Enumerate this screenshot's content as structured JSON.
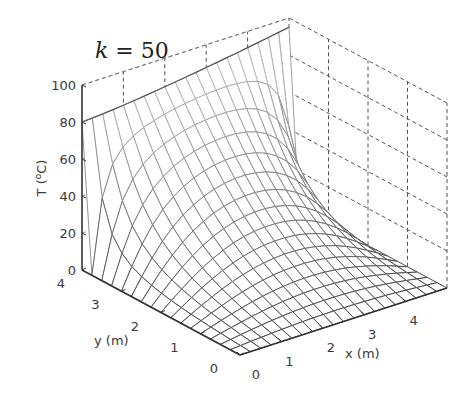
{
  "chart_data": {
    "type": "surface",
    "title_var": "k",
    "title_eq": " = 50",
    "title": "k = 50",
    "xlabel": "x (m)",
    "ylabel": "y (m)",
    "zlabel": "T (°C)",
    "zlabel_parts": [
      "T (",
      "o",
      "C)"
    ],
    "xlim": [
      0,
      5
    ],
    "ylim": [
      0,
      4
    ],
    "zlim": [
      0,
      100
    ],
    "xticks": [
      0,
      1,
      2,
      3,
      4
    ],
    "yticks": [
      0,
      1,
      2,
      3,
      4
    ],
    "zticks": [
      0,
      20,
      40,
      60,
      80,
      100
    ],
    "grid": true,
    "grid_divisions": {
      "x": 20,
      "y": 16
    },
    "boundary": {
      "edge_y_max_temperature_range": [
        80,
        95
      ],
      "other_edges_temperature": 0
    }
  }
}
